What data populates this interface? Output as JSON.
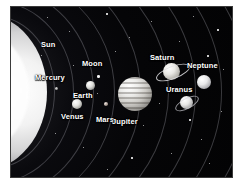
{
  "image": {
    "title": "Solar System Diagram",
    "background_color": "#050508",
    "border_color": "#ffffff",
    "label_color": "#ffffff"
  },
  "bodies": [
    {
      "name": "Sun",
      "label": "Sun",
      "label_x": 30,
      "label_y": 33,
      "font_size": 7.5
    },
    {
      "name": "Mercury",
      "label": "Mercury",
      "label_x": 33,
      "label_y": 66,
      "font_size": 7.5,
      "x": 44,
      "y": 80
    },
    {
      "name": "Venus",
      "label": "Venus",
      "label_x": 50,
      "label_y": 105,
      "font_size": 7.5,
      "x": 61,
      "y": 92
    },
    {
      "name": "Earth",
      "label": "Earth",
      "label_x": 62,
      "label_y": 84,
      "font_size": 7.5,
      "x": 75,
      "y": 74
    },
    {
      "name": "Moon",
      "label": "Moon",
      "label_x": 71,
      "label_y": 57,
      "font_size": 7.5,
      "x": 86,
      "y": 68
    },
    {
      "name": "Mars",
      "label": "Mars",
      "label_x": 85,
      "label_y": 108,
      "font_size": 7.5,
      "x": 93,
      "y": 95
    },
    {
      "name": "Jupiter",
      "label": "Jupiter",
      "label_x": 106,
      "label_y": 108,
      "font_size": 7.5,
      "x": 107,
      "y": 70
    },
    {
      "name": "Saturn",
      "label": "Saturn",
      "label_x": 142,
      "label_y": 52,
      "font_size": 7.5,
      "x": 152,
      "y": 62
    },
    {
      "name": "Uranus",
      "label": "Uranus",
      "label_x": 158,
      "label_y": 81,
      "font_size": 7.5,
      "x": 169,
      "y": 92
    },
    {
      "name": "Neptune",
      "label": "Neptune",
      "label_x": 173,
      "label_y": 58,
      "font_size": 7.5,
      "x": 186,
      "y": 68
    }
  ]
}
